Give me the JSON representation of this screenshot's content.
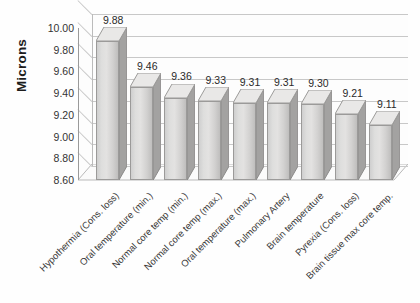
{
  "chart_data": {
    "type": "bar",
    "title": "",
    "subtitle": "",
    "xlabel": "",
    "ylabel": "Microns",
    "ylim": [
      8.6,
      10.0
    ],
    "ytick_step": 0.2,
    "ytick_labels": [
      "10.00",
      "9.80",
      "9.60",
      "9.40",
      "9.20",
      "9.00",
      "8.80",
      "8.60"
    ],
    "ytick_values": [
      10.0,
      9.8,
      9.6,
      9.4,
      9.2,
      9.0,
      8.8,
      8.6
    ],
    "grid": true,
    "legend": false,
    "legend_position": "none",
    "three_d": true,
    "categories": [
      "Hypothermia (Cons. loss)",
      "Oral temperature (min.)",
      "Normal core temp (min.)",
      "Normal core temp (max.)",
      "Oral temperature (max.)",
      "Pulmonary Artery",
      "Brain temperature",
      "Pyrexia (Cons. loss)",
      "Brain tissue max core temp."
    ],
    "values": [
      9.88,
      9.46,
      9.36,
      9.33,
      9.31,
      9.31,
      9.3,
      9.21,
      9.11
    ],
    "data_labels": [
      "9.88",
      "9.46",
      "9.36",
      "9.33",
      "9.31",
      "9.31",
      "9.30",
      "9.21",
      "9.11"
    ],
    "series": [
      {
        "name": "Microns",
        "values": [
          9.88,
          9.46,
          9.36,
          9.33,
          9.31,
          9.31,
          9.3,
          9.21,
          9.11
        ]
      }
    ],
    "colors": {
      "bar_front": "#dedddc",
      "bar_side": "#a09f9e",
      "bar_outline": "#9b9a99",
      "gridline": "#c8c8c8",
      "axis": "#9a9a9a",
      "background": "#fefefe",
      "text": "#2b2b2b"
    }
  }
}
